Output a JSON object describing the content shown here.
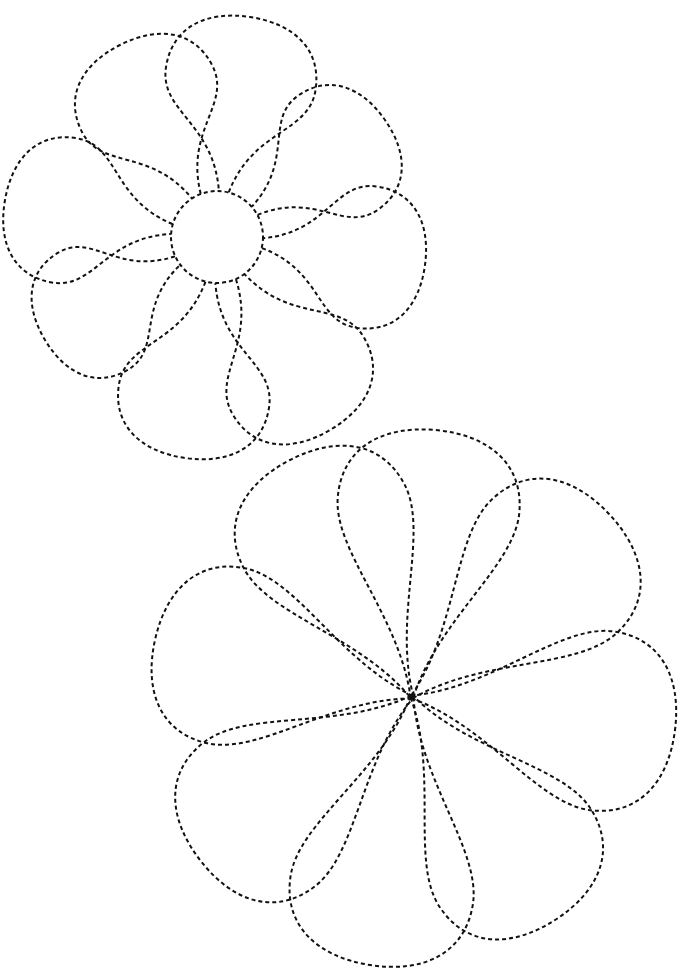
{
  "worksheet": {
    "type": "tracing-worksheet",
    "subject": "flowers",
    "line_style": "dashed",
    "stroke_color": "#111111",
    "background": "#ffffff",
    "flowers": [
      {
        "name": "flower-with-center-circle",
        "center": [
          217,
          237
        ],
        "center_radius": 46,
        "petal_count": 8,
        "petal_tips": [
          [
            120,
            45
          ],
          [
            250,
            17
          ],
          [
            385,
            120
          ],
          [
            425,
            265
          ],
          [
            330,
            430
          ],
          [
            185,
            458
          ],
          [
            45,
            340
          ],
          [
            5,
            200
          ]
        ]
      },
      {
        "name": "flower-with-center-point",
        "center": [
          412,
          697
        ],
        "center_radius": 0,
        "petal_count": 8,
        "petal_tips": [
          [
            290,
            460
          ],
          [
            435,
            430
          ],
          [
            610,
            515
          ],
          [
            675,
            730
          ],
          [
            555,
            920
          ],
          [
            370,
            965
          ],
          [
            200,
            860
          ],
          [
            155,
            640
          ]
        ]
      }
    ],
    "caption": ""
  }
}
